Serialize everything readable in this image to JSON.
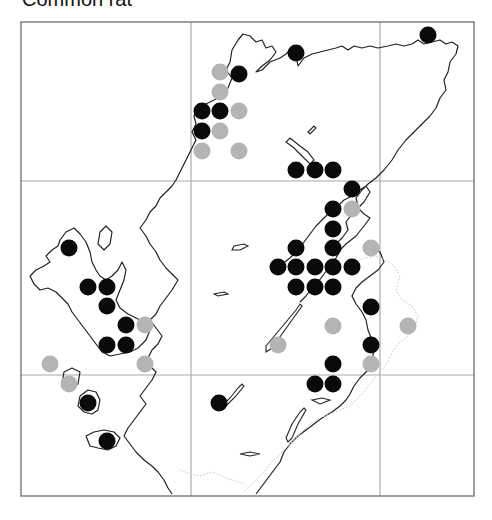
{
  "title": "Common rat",
  "map": {
    "frame": {
      "x": 21,
      "y": 22,
      "width": 453,
      "height": 474
    },
    "grid_x": [
      191,
      380
    ],
    "grid_y": [
      181,
      375
    ],
    "dot_radius": 8.5,
    "colors": {
      "black_dot": "#0a0a0a",
      "grey_dot": "#b4b4b4",
      "frame": "#777777",
      "grid": "#aaaaaa",
      "coast": "#222222",
      "border": "#cccccc"
    },
    "black_dots": [
      [
        428,
        35
      ],
      [
        296,
        53
      ],
      [
        239,
        74
      ],
      [
        202,
        111
      ],
      [
        220,
        111
      ],
      [
        202,
        131
      ],
      [
        296,
        170
      ],
      [
        315,
        170
      ],
      [
        333,
        170
      ],
      [
        352,
        189
      ],
      [
        333,
        209
      ],
      [
        333,
        229
      ],
      [
        333,
        248
      ],
      [
        296,
        248
      ],
      [
        278,
        267
      ],
      [
        296,
        267
      ],
      [
        315,
        267
      ],
      [
        333,
        267
      ],
      [
        352,
        267
      ],
      [
        296,
        287
      ],
      [
        315,
        287
      ],
      [
        333,
        287
      ],
      [
        371,
        307
      ],
      [
        371,
        345
      ],
      [
        333,
        364
      ],
      [
        315,
        384
      ],
      [
        333,
        384
      ],
      [
        69,
        248
      ],
      [
        88,
        287
      ],
      [
        107,
        287
      ],
      [
        107,
        306
      ],
      [
        126,
        325
      ],
      [
        107,
        345
      ],
      [
        126,
        345
      ],
      [
        88,
        403
      ],
      [
        219,
        403
      ],
      [
        107,
        441
      ]
    ],
    "grey_dots": [
      [
        220,
        72
      ],
      [
        220,
        92
      ],
      [
        239,
        111
      ],
      [
        220,
        131
      ],
      [
        202,
        151
      ],
      [
        239,
        151
      ],
      [
        352,
        209
      ],
      [
        371,
        248
      ],
      [
        145,
        325
      ],
      [
        333,
        326
      ],
      [
        408,
        326
      ],
      [
        278,
        345
      ],
      [
        50,
        364
      ],
      [
        145,
        364
      ],
      [
        371,
        364
      ],
      [
        69,
        384
      ]
    ]
  }
}
